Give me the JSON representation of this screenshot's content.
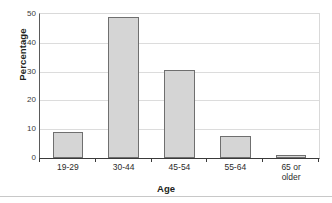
{
  "chart_data": {
    "type": "bar",
    "title": "",
    "subtitle": "",
    "xlabel": "Age",
    "ylabel": "Percentage",
    "categories": [
      "19-29",
      "30-44",
      "45-54",
      "55-64",
      "65 or older"
    ],
    "category_lines": [
      [
        "19-29"
      ],
      [
        "30-44"
      ],
      [
        "45-54"
      ],
      [
        "55-64"
      ],
      [
        "65 or",
        "older"
      ]
    ],
    "values": [
      9,
      49,
      30.5,
      7.5,
      1
    ],
    "ylim": [
      0,
      50
    ],
    "yticks": [
      0,
      10,
      20,
      30,
      40,
      50
    ],
    "ytick_labels": [
      "0",
      "10",
      "20",
      "30",
      "40",
      "50"
    ],
    "grid": "horizontal",
    "legend": "none",
    "bar_fill_color": "#d5d5d5",
    "bar_edge_color": "#6f6f6f",
    "gridline_color": "#dcdcdc",
    "axis_color": "#3a3a3a",
    "text_color": "#231f20",
    "background_color": "#ffffff"
  }
}
